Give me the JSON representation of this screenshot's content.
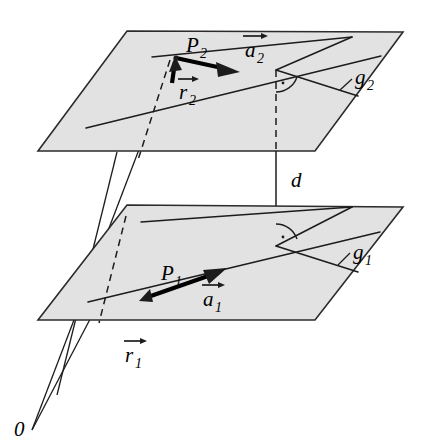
{
  "figure": {
    "background_color": "#ffffff",
    "plane_fill_color": "#e2e2e2",
    "stroke_color": "#1c1c1c"
  },
  "labels": {
    "origin": "0",
    "distance": "d",
    "point_upper": "P",
    "point_upper_sub": "2",
    "point_lower": "P",
    "point_lower_sub": "1",
    "dir_upper": "a",
    "dir_upper_sub": "2",
    "dir_lower": "a",
    "dir_lower_sub": "1",
    "pos_upper": "r",
    "pos_upper_sub": "2",
    "pos_lower": "r",
    "pos_lower_sub": "1",
    "line_upper": "g",
    "line_upper_sub": "2",
    "line_lower": "g",
    "line_lower_sub": "1"
  },
  "elements": {
    "upper_plane_name": "upper-plane",
    "lower_plane_name": "lower-plane",
    "distance_segment_name": "distance-segment",
    "right_angle_upper": "right-angle-marker-upper",
    "right_angle_lower": "right-angle-marker-lower"
  },
  "geometry": {
    "upper_plane_points": "127,31 403,32 315,151 38,151",
    "lower_plane_points": "127,205 403,207 315,320 38,320",
    "upper_line_g2": "88,125 380,55",
    "upper_line_main": "65,131 352,37",
    "lower_line_g1": "90,292 378,233",
    "lower_line_main": "66,300 353,208",
    "vertical_dashed": "276,70 276,151",
    "vertical_solid": "276,151 276,244",
    "left_dashed_upper": "168,58 138,152",
    "left_dashed_lower": "126,218 100,321",
    "ray_origin_to_upper": "32,430 172,63",
    "ray_origin_to_lower": "32,430 118,258",
    "diag_left_long": "117,152 68,330"
  }
}
